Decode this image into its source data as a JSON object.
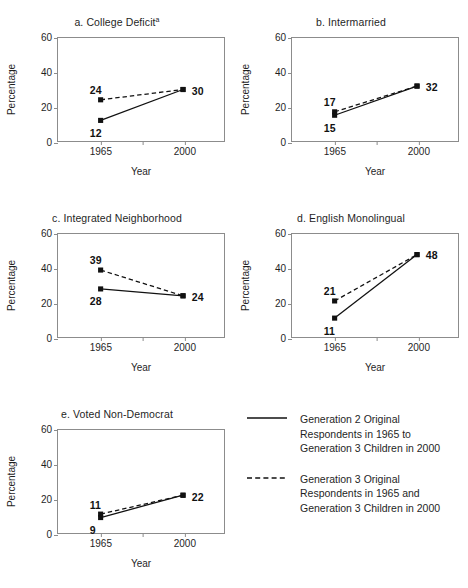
{
  "figure": {
    "axis_color": "#8c8c8c",
    "series_color": "#111111",
    "background": "#ffffff"
  },
  "axes": {
    "ylabel": "Percentage",
    "xlabel": "Year",
    "yticks": [
      "0",
      "20",
      "40",
      "60"
    ],
    "xticks": [
      "1965",
      "",
      "2000"
    ]
  },
  "legend": {
    "items": [
      {
        "style": "solid",
        "swatch_name": "solid-line-swatch",
        "label": "Generation 2 Original Respondents in 1965 to Generation 3 Children in 2000"
      },
      {
        "style": "dashed",
        "swatch_name": "dashed-line-swatch",
        "label": "Generation 3 Original Respondents in 1965 and Generation 3 Children in 2000"
      }
    ]
  },
  "chart_data": [
    {
      "type": "line",
      "panel": "a",
      "title": "a. College Deficit",
      "title_superscript": "a",
      "xlabel": "Year",
      "ylabel": "Percentage",
      "x": [
        "1965",
        "2000"
      ],
      "ylim": [
        0,
        60
      ],
      "yticks": [
        0,
        20,
        40,
        60
      ],
      "grid": false,
      "series": [
        {
          "name": "Generation 2 Original Respondents in 1965 to Generation 3 Children in 2000",
          "style": "solid",
          "values": [
            12,
            30
          ]
        },
        {
          "name": "Generation 3 Original Respondents in 1965 and Generation 3 Children in 2000",
          "style": "dashed",
          "values": [
            24,
            30
          ]
        }
      ],
      "annotations": [
        {
          "text": "24",
          "value": 24,
          "at": "1965",
          "series": "dashed",
          "pos": "above-left"
        },
        {
          "text": "12",
          "value": 12,
          "at": "1965",
          "series": "solid",
          "pos": "below-left"
        },
        {
          "text": "30",
          "value": 30,
          "at": "2000",
          "series": "both",
          "pos": "right"
        }
      ]
    },
    {
      "type": "line",
      "panel": "b",
      "title": "b. Intermarried",
      "title_superscript": "",
      "xlabel": "Year",
      "ylabel": "Percentage",
      "x": [
        "1965",
        "2000"
      ],
      "ylim": [
        0,
        60
      ],
      "yticks": [
        0,
        20,
        40,
        60
      ],
      "grid": false,
      "series": [
        {
          "name": "Generation 2 Original Respondents in 1965 to Generation 3 Children in 2000",
          "style": "solid",
          "values": [
            15,
            32
          ]
        },
        {
          "name": "Generation 3 Original Respondents in 1965 and Generation 3 Children in 2000",
          "style": "dashed",
          "values": [
            17,
            32
          ]
        }
      ],
      "annotations": [
        {
          "text": "17",
          "value": 17,
          "at": "1965",
          "series": "dashed",
          "pos": "above-left"
        },
        {
          "text": "15",
          "value": 15,
          "at": "1965",
          "series": "solid",
          "pos": "below-left"
        },
        {
          "text": "32",
          "value": 32,
          "at": "2000",
          "series": "both",
          "pos": "right"
        }
      ]
    },
    {
      "type": "line",
      "panel": "c",
      "title": "c. Integrated Neighborhood",
      "title_superscript": "",
      "xlabel": "Year",
      "ylabel": "Percentage",
      "x": [
        "1965",
        "2000"
      ],
      "ylim": [
        0,
        60
      ],
      "yticks": [
        0,
        20,
        40,
        60
      ],
      "grid": false,
      "series": [
        {
          "name": "Generation 2 Original Respondents in 1965 to Generation 3 Children in 2000",
          "style": "solid",
          "values": [
            28,
            24
          ]
        },
        {
          "name": "Generation 3 Original Respondents in 1965 and Generation 3 Children in 2000",
          "style": "dashed",
          "values": [
            39,
            24
          ]
        }
      ],
      "annotations": [
        {
          "text": "39",
          "value": 39,
          "at": "1965",
          "series": "dashed",
          "pos": "above-left"
        },
        {
          "text": "28",
          "value": 28,
          "at": "1965",
          "series": "solid",
          "pos": "below-left"
        },
        {
          "text": "24",
          "value": 24,
          "at": "2000",
          "series": "both",
          "pos": "right"
        }
      ]
    },
    {
      "type": "line",
      "panel": "d",
      "title": "d. English Monolingual",
      "title_superscript": "",
      "xlabel": "Year",
      "ylabel": "Percentage",
      "x": [
        "1965",
        "2000"
      ],
      "ylim": [
        0,
        60
      ],
      "yticks": [
        0,
        20,
        40,
        60
      ],
      "grid": false,
      "series": [
        {
          "name": "Generation 2 Original Respondents in 1965 to Generation 3 Children in 2000",
          "style": "solid",
          "values": [
            11,
            48
          ]
        },
        {
          "name": "Generation 3 Original Respondents in 1965 and Generation 3 Children in 2000",
          "style": "dashed",
          "values": [
            21,
            48
          ]
        }
      ],
      "annotations": [
        {
          "text": "21",
          "value": 21,
          "at": "1965",
          "series": "dashed",
          "pos": "above-left"
        },
        {
          "text": "11",
          "value": 11,
          "at": "1965",
          "series": "solid",
          "pos": "below-left"
        },
        {
          "text": "48",
          "value": 48,
          "at": "2000",
          "series": "both",
          "pos": "right"
        }
      ]
    },
    {
      "type": "line",
      "panel": "e",
      "title": "e. Voted Non-Democrat",
      "title_superscript": "",
      "xlabel": "Year",
      "ylabel": "Percentage",
      "x": [
        "1965",
        "2000"
      ],
      "ylim": [
        0,
        60
      ],
      "yticks": [
        0,
        20,
        40,
        60
      ],
      "grid": false,
      "series": [
        {
          "name": "Generation 2 Original Respondents in 1965 to Generation 3 Children in 2000",
          "style": "solid",
          "values": [
            9,
            22
          ]
        },
        {
          "name": "Generation 3 Original Respondents in 1965 and Generation 3 Children in 2000",
          "style": "dashed",
          "values": [
            11,
            22
          ]
        }
      ],
      "annotations": [
        {
          "text": "11",
          "value": 11,
          "at": "1965",
          "series": "dashed",
          "pos": "above-left"
        },
        {
          "text": "9",
          "value": 9,
          "at": "1965",
          "series": "solid",
          "pos": "below-left"
        },
        {
          "text": "22",
          "value": 22,
          "at": "2000",
          "series": "both",
          "pos": "right"
        }
      ]
    }
  ]
}
